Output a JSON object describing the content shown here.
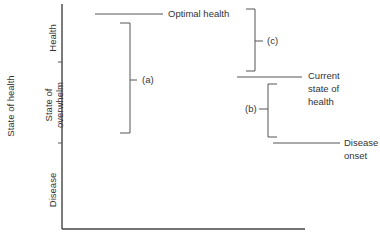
{
  "diagram": {
    "y_axis_title": "State of health",
    "zones": [
      {
        "label": "Health"
      },
      {
        "label_line1": "State of",
        "label_line2": "overwhelm"
      },
      {
        "label": "Disease"
      }
    ],
    "levels": {
      "optimal": {
        "label": "Optimal health"
      },
      "current": {
        "line1": "Current",
        "line2": "state of",
        "line3": "health"
      },
      "onset": {
        "line1": "Disease",
        "line2": "onset"
      }
    },
    "brackets": {
      "a": "(a)",
      "b": "(b)",
      "c": "(c)"
    },
    "colors": {
      "line": "#555555",
      "text": "#333333",
      "background": "#ffffff"
    }
  }
}
